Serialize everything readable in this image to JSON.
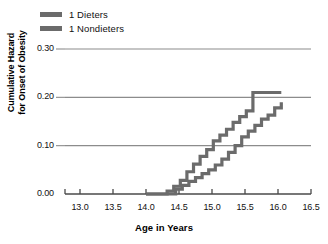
{
  "chart_data": {
    "type": "line",
    "title": "",
    "xlabel": "Age in Years",
    "ylabel_line1": "Cumulative Hazard",
    "ylabel_line2": "for Onset of Obesity",
    "xlim": [
      12.75,
      16.75
    ],
    "ylim": [
      0.0,
      0.32
    ],
    "xticks": [
      13.0,
      13.5,
      14.0,
      14.5,
      15.0,
      15.5,
      16.0,
      16.5
    ],
    "xticklabels": [
      "13.0",
      "13.5",
      "14.0",
      "14.5",
      "15.0",
      "15.5",
      "16.0",
      "16.5"
    ],
    "yticks": [
      0.0,
      0.1,
      0.2,
      0.3
    ],
    "yticklabels": [
      "0.00",
      "0.10",
      "0.20",
      "0.30"
    ],
    "grid": "horizontal",
    "legend_position": "top-left",
    "line_color": "#6b6b6b",
    "axis_color": "#4a4a4a",
    "grid_color": "#8c8c8c",
    "step_style": "post",
    "series": [
      {
        "name": "1 Dieters",
        "swatch_color": "#6b6b6b",
        "x": [
          14.0,
          14.3,
          14.45,
          14.55,
          14.65,
          14.75,
          14.85,
          14.95,
          15.05,
          15.15,
          15.25,
          15.35,
          15.45,
          15.55,
          15.65,
          15.75,
          15.85,
          15.95,
          16.05
        ],
        "y": [
          0.0,
          0.0,
          0.01,
          0.018,
          0.026,
          0.034,
          0.042,
          0.05,
          0.06,
          0.072,
          0.086,
          0.1,
          0.118,
          0.13,
          0.142,
          0.155,
          0.163,
          0.178,
          0.19
        ]
      },
      {
        "name": "1 Nondieters",
        "swatch_color": "#6b6b6b",
        "x": [
          14.0,
          14.2,
          14.32,
          14.42,
          14.52,
          14.62,
          14.72,
          14.82,
          14.92,
          15.02,
          15.12,
          15.22,
          15.32,
          15.42,
          15.52,
          15.62,
          16.05
        ],
        "y": [
          0.0,
          0.0,
          0.006,
          0.016,
          0.028,
          0.046,
          0.062,
          0.078,
          0.092,
          0.11,
          0.122,
          0.134,
          0.148,
          0.16,
          0.172,
          0.21,
          0.21
        ]
      }
    ]
  },
  "legend": {
    "items": [
      {
        "label": "1 Dieters",
        "color": "#6b6b6b"
      },
      {
        "label": "1 Nondieters",
        "color": "#6b6b6b"
      }
    ]
  }
}
